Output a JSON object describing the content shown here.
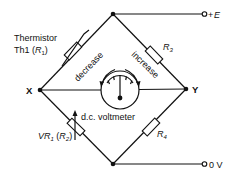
{
  "diagram": {
    "type": "Wheatstone bridge circuit",
    "nodes": {
      "x_label": "X",
      "y_label": "Y"
    },
    "terminals": {
      "supply_label": "+E",
      "supply_sign": "+",
      "supply_symbol": "E",
      "ground_label": "0 V"
    },
    "components": {
      "thermistor": {
        "label_line1": "Thermistor",
        "label_line2_prefix": "Th1  (",
        "label_line2_symbol": "R",
        "label_line2_sub": "1",
        "label_line2_suffix": ")"
      },
      "variable_resistor": {
        "prefix": "VR",
        "prefix_sub": "1",
        "mid": " (",
        "symbol": "R",
        "symbol_sub": "2",
        "suffix": ")"
      },
      "r3": {
        "symbol": "R",
        "sub": "3"
      },
      "r4": {
        "symbol": "R",
        "sub": "4"
      },
      "meter": {
        "label": "d.c. voltmeter",
        "decrease_label": "decrease",
        "increase_label": "increase"
      }
    },
    "colors": {
      "line": "#111111",
      "background": "#ffffff"
    }
  }
}
